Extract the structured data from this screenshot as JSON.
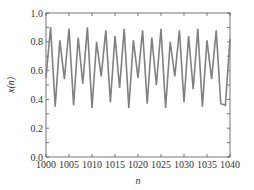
{
  "chart_data": {
    "type": "line",
    "title": "",
    "xlabel": "n",
    "ylabel": "x(n)",
    "xlim": [
      1000,
      1040
    ],
    "ylim": [
      0.0,
      1.0
    ],
    "xticks": [
      1000,
      1005,
      1010,
      1015,
      1020,
      1025,
      1030,
      1035,
      1040
    ],
    "xtick_labels": [
      "1000",
      "1005",
      "1010",
      "1015",
      "1020",
      "1025",
      "1030",
      "1035",
      "1040"
    ],
    "yticks": [
      0.0,
      0.2,
      0.4,
      0.6,
      0.8,
      1.0
    ],
    "ytick_labels": [
      "0.0",
      "0.2",
      "0.4",
      "0.6",
      "0.8",
      "1.0"
    ],
    "grid": false,
    "legend": null,
    "series": [
      {
        "name": "x(n)",
        "color": "#808080",
        "x": [
          1000,
          1001,
          1002,
          1003,
          1004,
          1005,
          1006,
          1007,
          1008,
          1009,
          1010,
          1011,
          1012,
          1013,
          1014,
          1015,
          1016,
          1017,
          1018,
          1019,
          1020,
          1021,
          1022,
          1023,
          1024,
          1025,
          1026,
          1027,
          1028,
          1029,
          1030,
          1031,
          1032,
          1033,
          1034,
          1035,
          1036,
          1037,
          1038,
          1039,
          1040
        ],
        "values": [
          0.55,
          0.9,
          0.35,
          0.81,
          0.54,
          0.89,
          0.36,
          0.83,
          0.51,
          0.9,
          0.34,
          0.8,
          0.56,
          0.88,
          0.38,
          0.84,
          0.48,
          0.89,
          0.34,
          0.81,
          0.55,
          0.88,
          0.37,
          0.83,
          0.5,
          0.89,
          0.34,
          0.8,
          0.56,
          0.88,
          0.38,
          0.84,
          0.47,
          0.89,
          0.35,
          0.81,
          0.54,
          0.88,
          0.37,
          0.36,
          0.82
        ]
      }
    ]
  }
}
